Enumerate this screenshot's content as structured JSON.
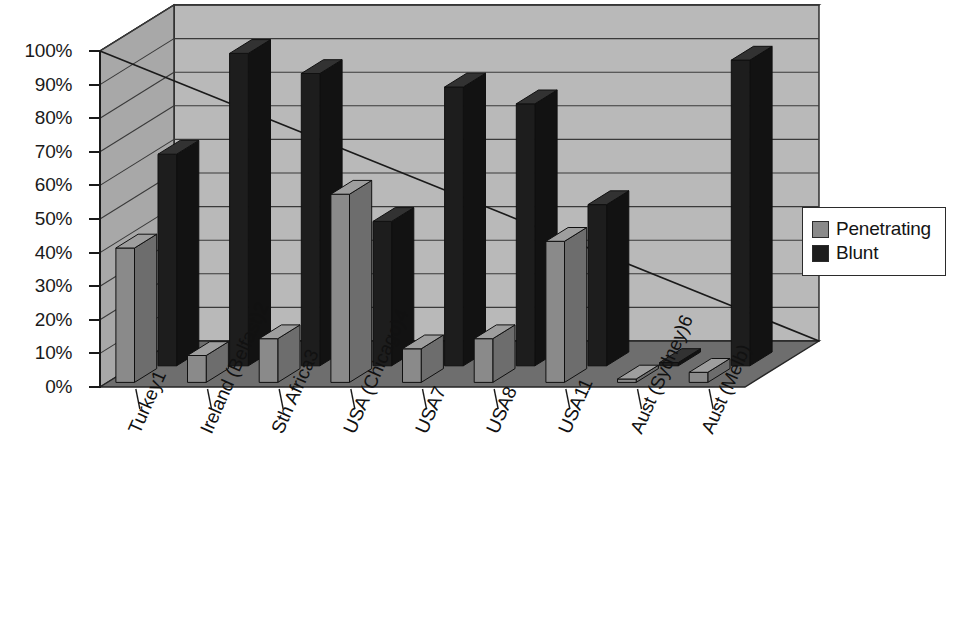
{
  "chart_data": {
    "type": "bar",
    "title": "",
    "subtitle": "",
    "xlabel": "",
    "ylabel": "",
    "ylim": [
      0,
      100
    ],
    "ytick_labels": [
      "0%",
      "10%",
      "20%",
      "30%",
      "40%",
      "50%",
      "60%",
      "70%",
      "80%",
      "90%",
      "100%"
    ],
    "ytick_values": [
      0,
      10,
      20,
      30,
      40,
      50,
      60,
      70,
      80,
      90,
      100
    ],
    "grid": true,
    "legend_position": "right",
    "projection": "3d-perspective",
    "categories": [
      "Turkey1",
      "Ireland (Belfast)2",
      "Sth Africa3",
      "USA (Chicago)4",
      "USA7",
      "USA8",
      "USA11",
      "Aust (Sydney)6",
      "Aust (Melb)"
    ],
    "series": [
      {
        "name": "Penetrating",
        "color": "#8a8a8a",
        "values": [
          40,
          8,
          13,
          56,
          10,
          13,
          42,
          1,
          3
        ]
      },
      {
        "name": "Blunt",
        "color": "#1d1d1d",
        "values": [
          63,
          93,
          87,
          43,
          83,
          78,
          48,
          1,
          91
        ]
      }
    ],
    "annotations": [
      {
        "type": "trend-line",
        "label": "",
        "from_percent": 100,
        "to_percent": 0
      }
    ]
  },
  "legend": {
    "items": [
      {
        "label": "Penetrating",
        "color": "#8a8a8a"
      },
      {
        "label": "Blunt",
        "color": "#1d1d1d"
      }
    ]
  },
  "colors": {
    "back_wall": "#b9b9b9",
    "side_wall": "#a8a8a8",
    "floor": "#6e6e6e",
    "ceiling": "#c2c2c2",
    "grid_line": "#3a3a3a",
    "outline": "#262626",
    "penetrating": "#8a8a8a",
    "penetrating_side": "#6d6d6d",
    "penetrating_top": "#9e9e9e",
    "blunt": "#1d1d1d",
    "blunt_side": "#121212",
    "blunt_top": "#323232",
    "text": "#141414"
  }
}
